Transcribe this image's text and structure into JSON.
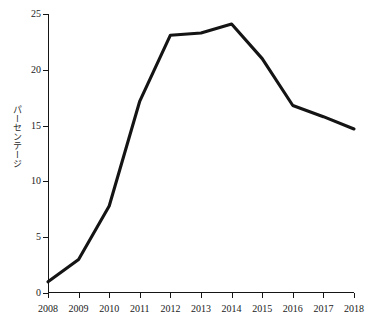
{
  "chart_data": {
    "type": "line",
    "title": "",
    "xlabel": "",
    "ylabel": "パーセンテージ",
    "categories": [
      "2008",
      "2009",
      "2010",
      "2011",
      "2012",
      "2013",
      "2014",
      "2015",
      "2016",
      "2017",
      "2018"
    ],
    "x": [
      2008,
      2009,
      2010,
      2011,
      2012,
      2013,
      2014,
      2015,
      2016,
      2017,
      2018
    ],
    "series": [
      {
        "name": "パーセンテージ",
        "color": "#141414",
        "values": [
          1.0,
          3.0,
          7.8,
          17.2,
          23.1,
          23.3,
          24.1,
          21.0,
          16.8,
          15.8,
          14.7
        ]
      }
    ],
    "ylim": [
      0,
      25
    ],
    "yticks": [
      0,
      5,
      10,
      15,
      20,
      25
    ],
    "ytick_labels": [
      "0",
      "5",
      "10",
      "15",
      "20",
      "25"
    ],
    "xlim": [
      2008,
      2018
    ],
    "grid": false,
    "legend": false,
    "legend_position": "none",
    "line_style": "solid",
    "markers": false
  },
  "axes": {
    "y_title": "パーセンテージ",
    "y_tick_labels": [
      "25",
      "20",
      "15",
      "10",
      "5",
      "0"
    ],
    "x_tick_labels": [
      "2008",
      "2009",
      "2010",
      "2011",
      "2012",
      "2013",
      "2014",
      "2015",
      "2016",
      "2017",
      "2018"
    ]
  },
  "colors": {
    "line": "#141414",
    "axis": "#151515",
    "text": "#1a1a1a",
    "background": "#ffffff"
  }
}
